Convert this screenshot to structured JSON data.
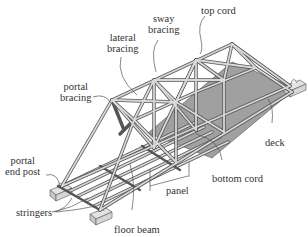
{
  "diagram": {
    "type": "truss bridge component diagram",
    "colors": {
      "steel": "#cfcfcf",
      "steel_edge": "#555555",
      "deck": "#9a9a9a",
      "abutment": "#d8d8d8",
      "leader": "#555555",
      "text": "#333333"
    },
    "labels": {
      "top_cord": "top cord",
      "sway_bracing_1": "sway",
      "sway_bracing_2": "bracing",
      "lateral_bracing_1": "lateral",
      "lateral_bracing_2": "bracing",
      "portal_bracing_1": "portal",
      "portal_bracing_2": "bracing",
      "portal_end_post_1": "portal",
      "portal_end_post_2": "end post",
      "stringers": "stringers",
      "floor_beam": "floor beam",
      "panel": "panel",
      "bottom_cord": "bottom cord",
      "deck": "deck"
    }
  }
}
